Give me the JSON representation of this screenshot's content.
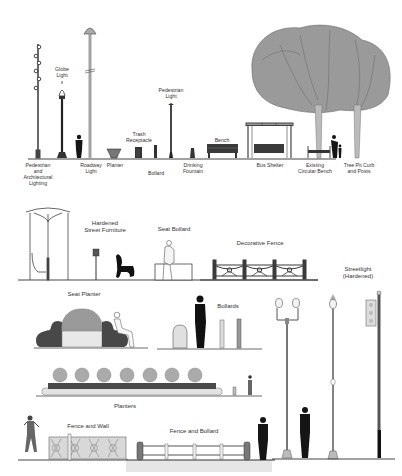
{
  "diagram": {
    "title": "",
    "sections": [
      {
        "id": "streetscape-elements",
        "items": [
          {
            "key": "ped_arch_lighting",
            "label": "Pedestrian\nand\nArchitectural\nLighting"
          },
          {
            "key": "globe_light",
            "label": "Globe\nLight"
          },
          {
            "key": "roadway_light",
            "label": "Roadway\nLight"
          },
          {
            "key": "planter",
            "label": "Planter"
          },
          {
            "key": "trash_receptacle",
            "label": "Trash\nReceptacle"
          },
          {
            "key": "bollard",
            "label": "Bollard"
          },
          {
            "key": "pedestrian_light",
            "label": "Pedestrian\nLight"
          },
          {
            "key": "drinking_fountain",
            "label": "Drinking\nFountain"
          },
          {
            "key": "bench",
            "label": "Bench"
          },
          {
            "key": "bus_shelter",
            "label": "Bus Shelter"
          },
          {
            "key": "circular_bench",
            "label": "Existing\nCircular Bench"
          },
          {
            "key": "tree_pit",
            "label": "Tree Pit Curb\nand Posts"
          }
        ]
      },
      {
        "id": "hardened-elements",
        "items": [
          {
            "key": "hardened_furniture",
            "label": "Hardened\nStreet Furniture"
          },
          {
            "key": "seat_bollard",
            "label": "Seat Bollard"
          },
          {
            "key": "decorative_fence",
            "label": "Decorative Fence"
          },
          {
            "key": "streetlight_hardened",
            "label": "Streetlight\n(Hardened)"
          },
          {
            "key": "seat_planter",
            "label": "Seat Planter"
          },
          {
            "key": "bollards",
            "label": "Bollards"
          },
          {
            "key": "planters",
            "label": "Planters"
          },
          {
            "key": "fence_wall",
            "label": "Fence and Wall"
          },
          {
            "key": "fence_bollard",
            "label": "Fence and Bollard"
          }
        ]
      }
    ],
    "colors": {
      "line": "#3a3a3a",
      "dark": "#1e1e1e",
      "foliage": "#8a8a8a",
      "light_fill": "#e6e6e6",
      "planter_dark": "#4a4a4a"
    }
  }
}
